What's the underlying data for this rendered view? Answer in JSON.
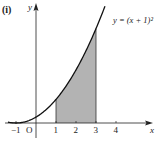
{
  "panel_label": "(i)",
  "chart_data": {
    "type": "area",
    "title": "",
    "function_label": "y = (x + 1)²",
    "function": "(x+1)^2",
    "xlabel": "x",
    "ylabel": "y",
    "x_ticks": [
      -1,
      1,
      2,
      3,
      4
    ],
    "x_tick_labels": [
      "−1",
      "1",
      "2",
      "3",
      "4"
    ],
    "origin_label": "O",
    "xlim": [
      -1.45,
      5.8
    ],
    "ylim": [
      0,
      20
    ],
    "shaded_region": {
      "from": 1,
      "to": 3,
      "under": "y = (x + 1)²"
    },
    "curve_x_range": [
      -1.4,
      3.45
    ],
    "grid": false,
    "colors": {
      "curve": "#111111",
      "axes": "#222222",
      "shade": "#b3b3b3",
      "shade_edge": "#333333"
    }
  }
}
